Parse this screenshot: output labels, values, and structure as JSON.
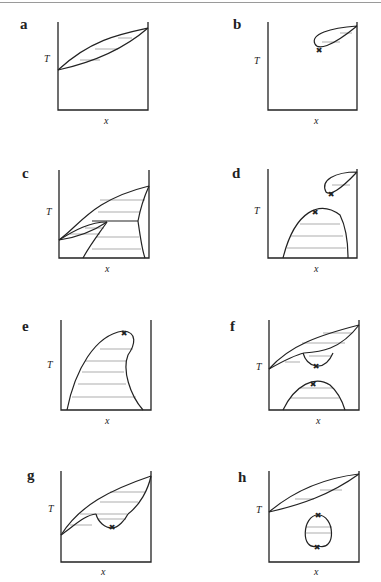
{
  "figure": {
    "colors": {
      "ink": "#222222",
      "tie_line": "#777777",
      "rule": "#9a9a9a",
      "background": "#ffffff"
    },
    "axis_labels": {
      "y": "T",
      "x": "x"
    },
    "critical_point_marker": "✖",
    "panels": [
      {
        "id": "a",
        "label": "a",
        "box": {
          "x0": 58,
          "y0": 22,
          "x1": 148,
          "y1": 110
        },
        "label_pos": [
          20,
          29
        ],
        "T_pos": [
          44,
          62
        ],
        "x_pos": [
          104,
          124
        ],
        "curves": [
          "M58,70 C90,40 120,34 148,28",
          "M58,70 C95,62 125,48 148,28"
        ],
        "ties": [
          [
            80,
            60,
            100,
            60
          ],
          [
            95,
            49,
            118,
            49
          ],
          [
            118,
            38,
            132,
            38
          ]
        ],
        "crit": []
      },
      {
        "id": "b",
        "label": "b",
        "box": {
          "x0": 268,
          "y0": 22,
          "x1": 357,
          "y1": 110
        },
        "label_pos": [
          233,
          29
        ],
        "T_pos": [
          254,
          64
        ],
        "x_pos": [
          314,
          124
        ],
        "curves": [
          "M357,26 C330,28 310,34 315,44 C318,50 330,48 357,26"
        ],
        "ties": [
          [
            322,
            42,
            340,
            42
          ],
          [
            340,
            33,
            352,
            33
          ]
        ],
        "crit": [
          [
            319,
            50
          ]
        ]
      },
      {
        "id": "c",
        "label": "c",
        "box": {
          "x0": 59,
          "y0": 170,
          "x1": 149,
          "y1": 258
        },
        "label_pos": [
          22,
          178
        ],
        "T_pos": [
          46,
          215
        ],
        "x_pos": [
          105,
          272
        ],
        "curves": [
          "M59,240 C80,225 92,200 149,186",
          "M59,240 C80,237 95,230 107,222",
          "M92,221 L138,221",
          "M59,240 C75,230 90,222 107,222",
          "M107,222 C98,235 90,245 83,258",
          "M138,221 C140,210 145,195 149,186",
          "M138,221 C140,235 142,250 145,258"
        ],
        "ties": [
          [
            100,
            200,
            145,
            200
          ],
          [
            98,
            212,
            140,
            212
          ],
          [
            70,
            234,
            100,
            234
          ],
          [
            85,
            228,
            104,
            228
          ],
          [
            97,
            237,
            139,
            237
          ],
          [
            92,
            249,
            141,
            249
          ]
        ],
        "crit": []
      },
      {
        "id": "d",
        "label": "d",
        "box": {
          "x0": 268,
          "y0": 169,
          "x1": 357,
          "y1": 258
        },
        "label_pos": [
          232,
          178
        ],
        "T_pos": [
          254,
          214
        ],
        "x_pos": [
          314,
          272
        ],
        "curves": [
          "M357,172 C335,172 320,180 326,192 C330,196 340,190 357,172",
          "M283,258 C295,210 320,200 340,215 C345,225 348,240 348,258"
        ],
        "ties": [
          [
            332,
            185,
            350,
            185
          ],
          [
            300,
            224,
            340,
            224
          ],
          [
            290,
            236,
            343,
            236
          ],
          [
            287,
            248,
            346,
            248
          ]
        ],
        "crit": [
          [
            331,
            194
          ],
          [
            315,
            212
          ]
        ]
      },
      {
        "id": "e",
        "label": "e",
        "box": {
          "x0": 61,
          "y0": 320,
          "x1": 151,
          "y1": 410
        },
        "label_pos": [
          22,
          331
        ],
        "T_pos": [
          47,
          368
        ],
        "x_pos": [
          105,
          424
        ],
        "curves": [
          "M67,410 C75,370 95,335 123,331 C138,332 135,345 128,355 C122,370 130,395 143,410"
        ],
        "ties": [
          [
            100,
            349,
            133,
            349
          ],
          [
            85,
            361,
            126,
            361
          ],
          [
            82,
            372,
            124,
            372
          ],
          [
            78,
            384,
            126,
            384
          ],
          [
            72,
            397,
            136,
            397
          ]
        ],
        "crit": [
          [
            124,
            333
          ]
        ]
      },
      {
        "id": "f",
        "label": "f",
        "box": {
          "x0": 269,
          "y0": 320,
          "x1": 359,
          "y1": 410
        },
        "label_pos": [
          230,
          331
        ],
        "T_pos": [
          256,
          370
        ],
        "x_pos": [
          316,
          424
        ],
        "curves": [
          "M269,369 C290,345 320,335 359,325",
          "M269,369 C285,360 295,355 304,353",
          "M304,353 C320,352 340,350 359,325",
          "M303,353 C305,360 310,365 316,366 C325,367 330,360 333,353",
          "M283,410 C295,385 315,375 330,385 C338,392 342,400 345,410"
        ],
        "ties": [
          [
            323,
            333,
            352,
            333
          ],
          [
            302,
            343,
            345,
            343
          ],
          [
            285,
            362,
            300,
            362
          ],
          [
            309,
            356,
            331,
            356
          ],
          [
            300,
            388,
            333,
            388
          ],
          [
            291,
            398,
            339,
            398
          ]
        ],
        "crit": [
          [
            316,
            366
          ],
          [
            313,
            384
          ]
        ]
      },
      {
        "id": "g",
        "label": "g",
        "box": {
          "x0": 61,
          "y0": 471,
          "x1": 151,
          "y1": 562
        },
        "label_pos": [
          27,
          480
        ],
        "T_pos": [
          48,
          512
        ],
        "x_pos": [
          101,
          575
        ],
        "curves": [
          "M61,535 C80,505 110,490 151,476",
          "M61,535 C75,525 85,515 96,514",
          "M96,514 C98,522 105,528 112,528 C118,528 125,520 128,514",
          "M128,514 C140,505 148,490 151,476"
        ],
        "ties": [
          [
            110,
            492,
            145,
            492
          ],
          [
            100,
            502,
            138,
            502
          ],
          [
            80,
            514,
            127,
            514
          ],
          [
            70,
            525,
            92,
            525
          ],
          [
            98,
            519,
            126,
            519
          ]
        ],
        "crit": [
          [
            112,
            527
          ]
        ]
      },
      {
        "id": "h",
        "label": "h",
        "box": {
          "x0": 269,
          "y0": 471,
          "x1": 359,
          "y1": 562
        },
        "label_pos": [
          238,
          482
        ],
        "T_pos": [
          256,
          513
        ],
        "x_pos": [
          314,
          575
        ],
        "curves": [
          "M269,512 C295,490 325,478 359,474",
          "M269,512 C300,505 330,495 359,474",
          "M318,515 C335,515 337,552 318,546 C300,552 302,515 318,515"
        ],
        "ties": [
          [
            295,
            499,
            314,
            499
          ],
          [
            320,
            490,
            342,
            490
          ],
          [
            306,
            527,
            332,
            527
          ],
          [
            306,
            533,
            332,
            533
          ]
        ],
        "crit": [
          [
            318,
            515
          ],
          [
            317,
            547
          ]
        ]
      }
    ]
  }
}
